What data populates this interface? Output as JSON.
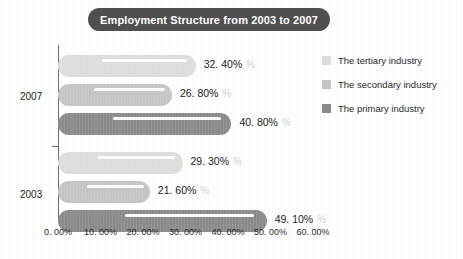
{
  "title": "Employment Structure from 2003 to 2007",
  "colors": {
    "title_pill": "#4f4f4f",
    "tertiary": "#dcdcdc",
    "secondary": "#c4c4c4",
    "primary": "#8a8a8a",
    "axis": "#6b6b6b",
    "text": "#1a1a1a",
    "background": "#ffffff"
  },
  "legend": {
    "items": [
      {
        "label": "The tertiary industry",
        "color": "#dcdcdc"
      },
      {
        "label": "The secondary industry",
        "color": "#c4c4c4"
      },
      {
        "label": "The primary industry",
        "color": "#8a8a8a"
      }
    ]
  },
  "axis": {
    "y_groups": [
      "2007",
      "2003"
    ],
    "x_ticks": [
      "0. 00%",
      "10. 00%",
      "20. 00%",
      "30. 00%",
      "40. 00%",
      "50. 00%",
      "60. 00%"
    ]
  },
  "bars": [
    {
      "group": "2007",
      "series": "The tertiary industry",
      "value": 32.4,
      "label": "32. 40%",
      "color": "#dcdcdc"
    },
    {
      "group": "2007",
      "series": "The secondary industry",
      "value": 26.8,
      "label": "26. 80%",
      "color": "#c4c4c4"
    },
    {
      "group": "2007",
      "series": "The primary industry",
      "value": 40.8,
      "label": "40. 80%",
      "color": "#8a8a8a"
    },
    {
      "group": "2003",
      "series": "The tertiary industry",
      "value": 29.3,
      "label": "29. 30%",
      "color": "#dcdcdc"
    },
    {
      "group": "2003",
      "series": "The secondary industry",
      "value": 21.6,
      "label": "21. 60%",
      "color": "#c4c4c4"
    },
    {
      "group": "2003",
      "series": "The primary industry",
      "value": 49.1,
      "label": "49. 10%",
      "color": "#8a8a8a"
    }
  ],
  "ghost_pct": "%",
  "chart_data": {
    "type": "bar",
    "orientation": "horizontal",
    "title": "Employment Structure from 2003 to 2007",
    "xlabel": "",
    "ylabel": "",
    "categories": [
      "2007",
      "2003"
    ],
    "series": [
      {
        "name": "The tertiary industry",
        "values": [
          32.4,
          29.3
        ]
      },
      {
        "name": "The secondary industry",
        "values": [
          26.8,
          21.6
        ]
      },
      {
        "name": "The primary industry",
        "values": [
          40.8,
          49.1
        ]
      }
    ],
    "xlim": [
      0,
      60
    ],
    "x_tick_values": [
      0,
      10,
      20,
      30,
      40,
      50,
      60
    ],
    "x_tick_labels": [
      "0. 00%",
      "10. 00%",
      "20. 00%",
      "30. 00%",
      "40. 00%",
      "50. 00%",
      "60. 00%"
    ],
    "data_labels": [
      "32. 40%",
      "26. 80%",
      "40. 80%",
      "29. 30%",
      "21. 60%",
      "49. 10%"
    ],
    "grid": false,
    "legend_position": "right",
    "units": "percent"
  }
}
